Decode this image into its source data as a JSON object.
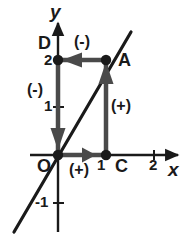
{
  "figure": {
    "kind": "coordinate-plane-diagram",
    "width": 186,
    "height": 239,
    "background": "#ffffff",
    "ink_color": "#1a1a1a",
    "stroke_color": "#3a3a3a"
  },
  "axes": {
    "x_label": "x",
    "y_label": "y",
    "origin_label": "O",
    "origin": {
      "px": 58,
      "py": 155
    },
    "unit_px": 48,
    "x_ticks": [
      {
        "value": "1",
        "px": 106
      },
      {
        "value": "2",
        "px": 154
      }
    ],
    "y_ticks": [
      {
        "value": "1",
        "py": 107
      },
      {
        "value": "2",
        "py": 60
      },
      {
        "value": "-1",
        "py": 203
      }
    ],
    "x_axis_from_px": 30,
    "x_axis_to_px": 181,
    "y_axis_from_py": 232,
    "y_axis_to_py": 20
  },
  "line": {
    "name": "diagonal-line",
    "description": "straight line through origin with slope 2",
    "x1": 14,
    "y1": 232,
    "x2": 131,
    "y2": 32
  },
  "points": [
    {
      "id": "A",
      "label": "A",
      "x": 1,
      "y": 2,
      "px": 106,
      "py": 60
    },
    {
      "id": "C",
      "label": "C",
      "x": 1,
      "y": 0,
      "px": 106,
      "py": 155
    },
    {
      "id": "D",
      "label": "D",
      "x": 0,
      "y": 2,
      "px": 58,
      "py": 60
    },
    {
      "id": "O",
      "label": "O",
      "x": 0,
      "y": 0,
      "px": 58,
      "py": 155
    }
  ],
  "segments": [
    {
      "id": "OC",
      "from": "O",
      "to": "C",
      "direction": "right",
      "sign_label": "(+)",
      "sign_x": 70,
      "sign_y": 163,
      "x1": 58,
      "y1": 155,
      "x2": 106,
      "y2": 155
    },
    {
      "id": "CA",
      "from": "C",
      "to": "A",
      "direction": "up",
      "sign_label": "(+)",
      "sign_x": 112,
      "sign_y": 99,
      "x1": 106,
      "y1": 155,
      "x2": 106,
      "y2": 60
    },
    {
      "id": "AD",
      "from": "A",
      "to": "D",
      "direction": "left",
      "sign_label": "(-)",
      "sign_x": 74,
      "sign_y": 36,
      "x1": 106,
      "y1": 60,
      "x2": 58,
      "y2": 60
    },
    {
      "id": "DO",
      "from": "D",
      "to": "O",
      "direction": "down",
      "sign_label": "(-)",
      "sign_x": 28,
      "sign_y": 83,
      "x1": 58,
      "y1": 60,
      "x2": 58,
      "y2": 155
    }
  ],
  "labels": {
    "A": {
      "text": "A",
      "x": 118,
      "y": 52
    },
    "C": {
      "text": "C",
      "x": 116,
      "y": 158
    },
    "D": {
      "text": "D",
      "x": 38,
      "y": 36
    },
    "O": {
      "text": "O",
      "x": 38,
      "y": 158
    },
    "x_axis": {
      "text": "x",
      "x": 168,
      "y": 160
    },
    "y_axis": {
      "text": "y",
      "x": 50,
      "y": 2
    },
    "tick_x1": {
      "text": "1",
      "x": 96,
      "y": 158
    },
    "tick_x2": {
      "text": "2",
      "x": 148,
      "y": 158
    },
    "tick_y1": {
      "text": "1",
      "x": 44,
      "y": 98
    },
    "tick_y2": {
      "text": "2",
      "x": 44,
      "y": 52
    },
    "tick_ym1": {
      "text": "-1",
      "x": 36,
      "y": 194
    }
  }
}
